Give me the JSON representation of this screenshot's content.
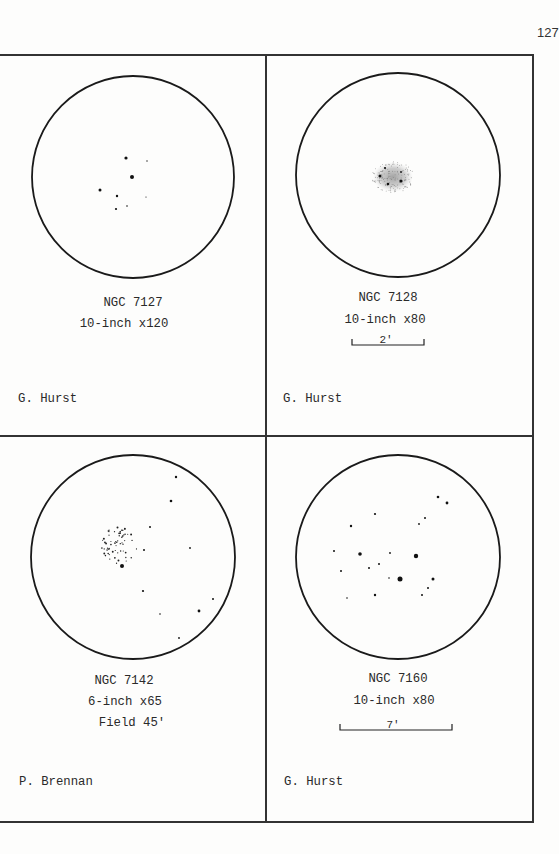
{
  "page": {
    "number": "127"
  },
  "panels": [
    {
      "object": "NGC 7127",
      "instrument": "10-inch x120",
      "observer": "G. Hurst",
      "field": null,
      "scale_bar": null,
      "circle": {
        "cx": 133,
        "cy": 177,
        "r": 101
      },
      "stars": [
        [
          126,
          158,
          1.6
        ],
        [
          147,
          161,
          0.7
        ],
        [
          132,
          177,
          2.0
        ],
        [
          100,
          190,
          1.5
        ],
        [
          117,
          196,
          1.2
        ],
        [
          146,
          197,
          0.6
        ],
        [
          116,
          209,
          1.1
        ],
        [
          127,
          206,
          0.8
        ]
      ]
    },
    {
      "object": "NGC 7128",
      "instrument": "10-inch x80",
      "observer": "G. Hurst",
      "field": null,
      "scale_bar": {
        "label": "2'",
        "x1": 352,
        "x2": 424,
        "y": 345
      },
      "circle": {
        "cx": 398,
        "cy": 175,
        "r": 102
      },
      "nebula": {
        "cx": 393,
        "cy": 177,
        "rx": 20,
        "ry": 15
      },
      "stars": [
        [
          385,
          168,
          1.1
        ],
        [
          380,
          176,
          1.5
        ],
        [
          401,
          172,
          0.9
        ],
        [
          401,
          181,
          1.6
        ],
        [
          388,
          184,
          1.3
        ]
      ]
    },
    {
      "object": "NGC 7142",
      "instrument": "6-inch x65",
      "observer": "P. Brennan",
      "field": "Field 45'",
      "scale_bar": null,
      "circle": {
        "cx": 133,
        "cy": 557,
        "r": 102
      },
      "stars": [
        [
          176,
          477,
          1.2
        ],
        [
          171,
          501,
          1.3
        ],
        [
          150,
          527,
          1.0
        ],
        [
          144,
          550,
          1.0
        ],
        [
          190,
          548,
          0.9
        ],
        [
          143,
          591,
          1.1
        ],
        [
          213,
          599,
          1.0
        ],
        [
          199,
          611,
          1.4
        ],
        [
          160,
          614,
          0.8
        ],
        [
          179,
          638,
          0.9
        ],
        [
          122,
          566,
          2.0
        ]
      ],
      "cluster": {
        "x1": 100,
        "y1": 527,
        "x2": 137,
        "y2": 564
      }
    },
    {
      "object": "NGC 7160",
      "instrument": "10-inch x80",
      "observer": "G. Hurst",
      "field": null,
      "scale_bar": {
        "label": "7'",
        "x1": 340,
        "x2": 452,
        "y": 730
      },
      "circle": {
        "cx": 398,
        "cy": 557,
        "r": 102
      },
      "stars": [
        [
          438,
          497,
          1.3
        ],
        [
          447,
          503,
          1.4
        ],
        [
          375,
          514,
          1.1
        ],
        [
          425,
          518,
          1.0
        ],
        [
          351,
          526,
          1.2
        ],
        [
          419,
          524,
          0.9
        ],
        [
          334,
          551,
          1.0
        ],
        [
          360,
          554,
          1.8
        ],
        [
          390,
          553,
          0.9
        ],
        [
          416,
          556,
          2.2
        ],
        [
          341,
          571,
          1.0
        ],
        [
          369,
          568,
          1.0
        ],
        [
          379,
          564,
          1.0
        ],
        [
          389,
          578,
          0.8
        ],
        [
          400,
          579,
          2.5
        ],
        [
          433,
          579,
          1.5
        ],
        [
          428,
          588,
          1.0
        ],
        [
          422,
          595,
          1.0
        ],
        [
          347,
          598,
          0.8
        ],
        [
          375,
          595,
          1.2
        ]
      ]
    }
  ]
}
